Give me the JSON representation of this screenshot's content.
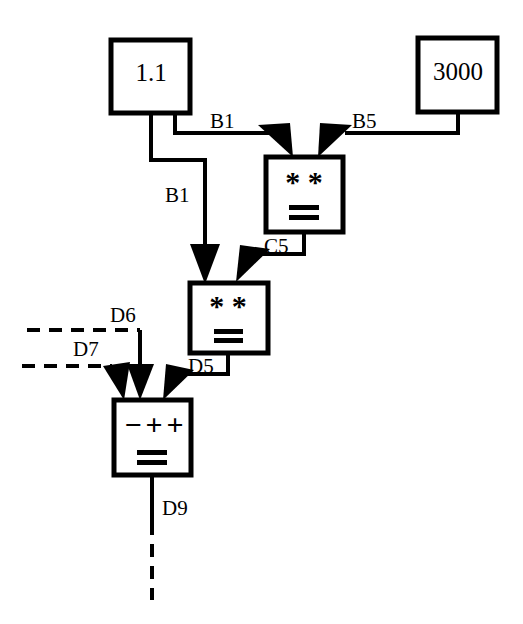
{
  "diagram": {
    "background_color": "#ffffff",
    "line_color": "#000000",
    "nodes": {
      "source_a": {
        "value": "1.1",
        "name": "constant-box-1-1"
      },
      "source_b": {
        "value": "3000",
        "name": "constant-box-3000"
      },
      "multiply_1": {
        "operator": "* *",
        "result_symbol": "="
      },
      "multiply_2": {
        "operator": "* *",
        "result_symbol": "="
      },
      "sum": {
        "operator_1": "−",
        "operator_2": "+",
        "operator_3": "+",
        "result_symbol": "="
      }
    },
    "edges": {
      "b1_right": "B1",
      "b5": "B5",
      "b1_down": "B1",
      "c5": "C5",
      "d5": "D5",
      "d6": "D6",
      "d7": "D7",
      "d9": "D9"
    }
  }
}
